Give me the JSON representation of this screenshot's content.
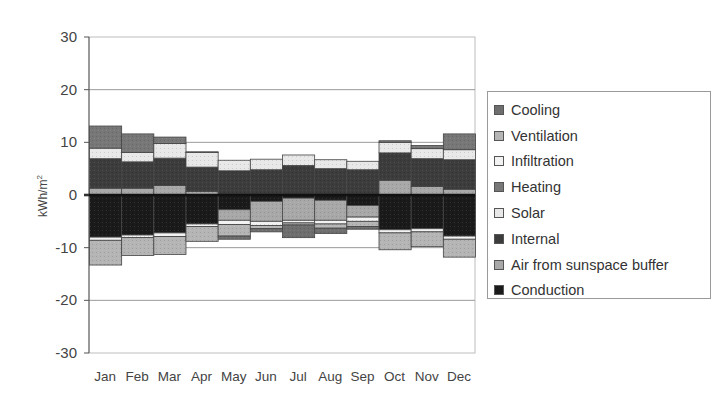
{
  "chart_data": {
    "type": "bar",
    "stacked": true,
    "title": "",
    "xlabel": "",
    "ylabel": "kWh/m²",
    "ylabel_main": "kWh/m",
    "ylabel_sup": "2",
    "ylim": [
      -30,
      30
    ],
    "yticks": [
      30,
      20,
      10,
      0,
      -10,
      -20,
      -30
    ],
    "grid": true,
    "legend_position": "right",
    "categories": [
      "Jan",
      "Feb",
      "Mar",
      "Apr",
      "May",
      "Jun",
      "Jul",
      "Aug",
      "Sep",
      "Oct",
      "Nov",
      "Dec"
    ],
    "series": [
      {
        "name": "Conduction",
        "color": "#1a1a1a",
        "values": [
          -8.0,
          -7.6,
          -7.2,
          -5.5,
          -2.8,
          -1.2,
          -0.6,
          -1.0,
          -2.0,
          -6.6,
          -6.4,
          -7.8
        ]
      },
      {
        "name": "Air from sunspace buffer",
        "color": "#a8a8a8",
        "values": [
          1.3,
          1.3,
          1.8,
          0.7,
          -2.0,
          -3.8,
          -4.2,
          -3.8,
          -2.2,
          2.8,
          1.6,
          1.1
        ]
      },
      {
        "name": "Internal",
        "color": "#3c3c3c",
        "values": [
          5.6,
          5.0,
          5.2,
          4.6,
          4.6,
          4.8,
          5.6,
          5.0,
          4.8,
          5.2,
          5.3,
          5.6
        ]
      },
      {
        "name": "Solar",
        "color": "#e8e8e8",
        "values": [
          2.0,
          1.8,
          2.8,
          2.8,
          2.0,
          2.0,
          2.0,
          1.7,
          1.6,
          2.0,
          1.9,
          1.9
        ]
      },
      {
        "name": "Heating",
        "color": "#777777",
        "values": [
          4.2,
          3.5,
          1.2,
          0.1,
          0,
          0,
          0,
          0,
          0,
          0.3,
          0.6,
          3.0
        ]
      },
      {
        "name": "Infiltration",
        "color": "#f2f2f2",
        "values": [
          -0.6,
          -0.5,
          -0.7,
          -0.5,
          -0.8,
          -0.8,
          -0.5,
          -0.7,
          -0.8,
          -0.6,
          -0.6,
          -0.6
        ]
      },
      {
        "name": "Ventilation",
        "color": "#b5b5b5",
        "values": [
          -4.7,
          -3.4,
          -3.4,
          -2.8,
          -2.2,
          -0.6,
          -0.4,
          -0.8,
          -1.0,
          -3.2,
          -2.8,
          -3.4
        ]
      },
      {
        "name": "Cooling",
        "color": "#6e6e6e",
        "values": [
          0,
          0,
          0,
          0,
          -0.6,
          -0.6,
          -2.4,
          -1.0,
          -0.5,
          0,
          0,
          0
        ]
      }
    ]
  },
  "axis": {
    "yticks": [
      "30",
      "20",
      "10",
      "0",
      "-10",
      "-20",
      "-30"
    ],
    "ylabel": "kWh/m",
    "ylabel_sup": "2"
  },
  "legend": {
    "items": [
      {
        "label": "Cooling",
        "color": "#6e6e6e"
      },
      {
        "label": "Ventilation",
        "color": "#b5b5b5"
      },
      {
        "label": "Infiltration",
        "color": "#f2f2f2"
      },
      {
        "label": "Heating",
        "color": "#777777"
      },
      {
        "label": "Solar",
        "color": "#e8e8e8"
      },
      {
        "label": "Internal",
        "color": "#3c3c3c"
      },
      {
        "label": "Air from sunspace buffer",
        "color": "#a8a8a8"
      },
      {
        "label": "Conduction",
        "color": "#1a1a1a"
      }
    ]
  }
}
